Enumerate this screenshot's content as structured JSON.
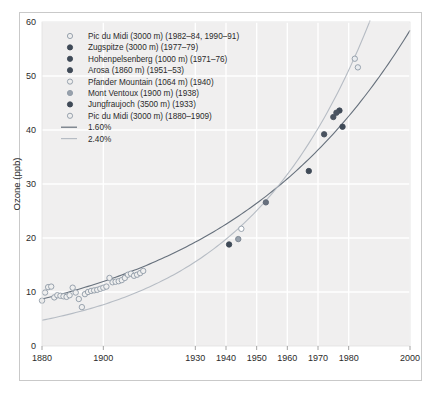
{
  "chart_data": {
    "type": "scatter",
    "title": "",
    "xlabel": "",
    "ylabel": "Ozone (ppb)",
    "xlim": [
      1880,
      2000
    ],
    "ylim": [
      0,
      60
    ],
    "xticks": [
      1880,
      1900,
      1930,
      1940,
      1950,
      1960,
      1970,
      1980,
      2000
    ],
    "xticklabels": [
      "1880",
      "1900",
      "1930",
      "1940",
      "1950",
      "1960",
      "1970",
      "1980",
      "2000"
    ],
    "yticks": [
      0,
      10,
      20,
      30,
      40,
      50,
      60
    ],
    "yticklabels": [
      "0",
      "10",
      "20",
      "30",
      "40",
      "50",
      "60"
    ],
    "grid": true,
    "grid_color": "#ffffff",
    "plot_bgcolor": "#f0efef",
    "legend_position": "upper-left",
    "series": [
      {
        "name": "Pic du Midi (3000 m) (1982–84, 1990–91)",
        "marker": "open-circle",
        "color": "#8e9aa6",
        "fill": "#e9ecef",
        "points": [
          [
            1982,
            53.2
          ],
          [
            1983,
            51.6
          ]
        ]
      },
      {
        "name": "Zugspitze (3000 m) (1977–79)",
        "marker": "filled-circle",
        "color": "#3f4a57",
        "fill": "#3f4a57",
        "points": [
          [
            1977,
            43.6
          ],
          [
            1978,
            40.6
          ]
        ]
      },
      {
        "name": "Hohenpelsenberg (1000 m) (1971–76)",
        "marker": "filled-circle",
        "color": "#4a5360",
        "fill": "#4a5360",
        "points": [
          [
            1972,
            39.2
          ],
          [
            1975,
            42.4
          ],
          [
            1976,
            43.2
          ]
        ]
      },
      {
        "name": "Arosa (1860 m) (1951–53)",
        "marker": "filled-circle",
        "color": "#5d6775",
        "fill": "#68707d",
        "points": [
          [
            1953,
            26.6
          ]
        ]
      },
      {
        "name": "Pfander Mountain (1064 m) (1940)",
        "marker": "open-circle",
        "color": "#8e9aa6",
        "fill": "#ffffff",
        "points": [
          [
            1945,
            21.7
          ]
        ]
      },
      {
        "name": "Mont Ventoux (1900 m) (1938)",
        "marker": "half-circle",
        "color": "#77818d",
        "fill": "#98a1ac",
        "points": [
          [
            1944,
            19.8
          ]
        ]
      },
      {
        "name": "Jungfraujoch (3500 m) (1933)",
        "marker": "filled-circle",
        "color": "#3f4a57",
        "fill": "#3f4a57",
        "points": [
          [
            1941,
            18.8
          ],
          [
            1967,
            32.4
          ]
        ]
      },
      {
        "name": "Pic du Midi (3000 m) (1880–1909)",
        "marker": "open-circle",
        "color": "#8e9aa6",
        "fill": "#efefef",
        "points": [
          [
            1880,
            8.4
          ],
          [
            1881,
            9.9
          ],
          [
            1882,
            10.9
          ],
          [
            1883,
            11.0
          ],
          [
            1884,
            9.0
          ],
          [
            1885,
            9.4
          ],
          [
            1886,
            9.3
          ],
          [
            1887,
            9.2
          ],
          [
            1888,
            9.1
          ],
          [
            1889,
            9.4
          ],
          [
            1890,
            10.8
          ],
          [
            1891,
            9.9
          ],
          [
            1892,
            8.7
          ],
          [
            1893,
            7.2
          ],
          [
            1894,
            9.6
          ],
          [
            1895,
            10.0
          ],
          [
            1896,
            10.2
          ],
          [
            1897,
            10.3
          ],
          [
            1898,
            10.4
          ],
          [
            1899,
            10.6
          ],
          [
            1900,
            10.8
          ],
          [
            1901,
            11.0
          ],
          [
            1902,
            12.6
          ],
          [
            1903,
            11.8
          ],
          [
            1904,
            11.9
          ],
          [
            1905,
            12.0
          ],
          [
            1906,
            12.2
          ],
          [
            1907,
            12.6
          ],
          [
            1908,
            13.2
          ],
          [
            1909,
            13.4
          ],
          [
            1910,
            13.0
          ],
          [
            1911,
            13.2
          ],
          [
            1912,
            13.5
          ],
          [
            1913,
            13.9
          ]
        ]
      }
    ],
    "trend_lines": [
      {
        "name": "1.60%",
        "color": "#66707c",
        "rate": 0.016,
        "base_year": 1880,
        "base_value": 8.7
      },
      {
        "name": "2.40%",
        "color": "#b6bcc4",
        "rate": 0.024,
        "base_year": 1930,
        "base_value": 15.6
      }
    ]
  },
  "legend": {
    "items": [
      {
        "label": "Pic du Midi (3000 m) (1982–84, 1990–91)",
        "marker": "open-circle"
      },
      {
        "label": "Zugspitze (3000 m) (1977–79)",
        "marker": "filled-circle"
      },
      {
        "label": "Hohenpelsenberg (1000 m) (1971–76)",
        "marker": "filled-circle"
      },
      {
        "label": "Arosa (1860 m) (1951–53)",
        "marker": "filled-circle"
      },
      {
        "label": "Pfander Mountain (1064 m) (1940)",
        "marker": "open-circle"
      },
      {
        "label": "Mont Ventoux (1900 m) (1938)",
        "marker": "half-circle"
      },
      {
        "label": "Jungfraujoch (3500 m) (1933)",
        "marker": "filled-circle"
      },
      {
        "label": "Pic du Midi (3000 m) (1880–1909)",
        "marker": "open-circle"
      },
      {
        "label": "1.60%",
        "marker": "line-dark"
      },
      {
        "label": "2.40%",
        "marker": "line-light"
      }
    ]
  },
  "colors": {
    "plot_background": "#f0efef",
    "gridline": "#ffffff",
    "frame_border": "#c9c9c9",
    "text": "#2b2b2b",
    "trend_dark": "#66707c",
    "trend_light": "#b6bcc4",
    "marker_open": "#8e9aa6",
    "marker_filled": "#3f4a57"
  }
}
